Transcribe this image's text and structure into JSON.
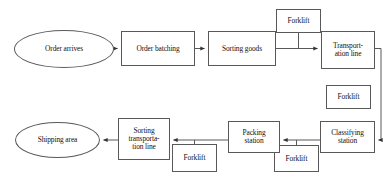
{
  "diagram": {
    "type": "flowchart",
    "canvas": {
      "width": 387,
      "height": 188
    },
    "style": {
      "stroke_color": "#595959",
      "text_color": "#111111",
      "background_color": "#ffffff"
    },
    "nodes": [
      {
        "id": "order-arrives",
        "label": "Order arrives",
        "shape": "ellipse",
        "x": 14,
        "y": 30,
        "w": 100,
        "h": 38,
        "font_size": 7.4
      },
      {
        "id": "order-batching",
        "label": "Order batching",
        "shape": "rect",
        "x": 121,
        "y": 31,
        "w": 74,
        "h": 35,
        "font_size": 7.4
      },
      {
        "id": "sorting-goods",
        "label": "Sorting goods",
        "shape": "rect",
        "x": 208,
        "y": 31,
        "w": 68,
        "h": 35,
        "font_size": 7.4
      },
      {
        "id": "forklift-top",
        "label": "Forklift",
        "shape": "rect",
        "x": 276,
        "y": 9,
        "w": 45,
        "h": 24,
        "font_size": 7.4
      },
      {
        "id": "transportation-line",
        "label": "Transport-\nation line",
        "shape": "rect",
        "x": 321,
        "y": 31,
        "w": 54,
        "h": 38,
        "font_size": 7.4
      },
      {
        "id": "forklift-right",
        "label": "Forklift",
        "shape": "rect",
        "x": 326,
        "y": 85,
        "w": 45,
        "h": 24,
        "font_size": 7.4
      },
      {
        "id": "classifying-station",
        "label": "Classifying\nstation",
        "shape": "rect",
        "x": 320,
        "y": 121,
        "w": 55,
        "h": 32,
        "font_size": 7.4
      },
      {
        "id": "forklift-bottom-right",
        "label": "Forklift",
        "shape": "rect",
        "x": 274,
        "y": 145,
        "w": 45,
        "h": 27,
        "font_size": 7.4
      },
      {
        "id": "packing-station",
        "label": "Packing\nstation",
        "shape": "rect",
        "x": 228,
        "y": 121,
        "w": 52,
        "h": 32,
        "font_size": 7.4
      },
      {
        "id": "forklift-bottom-left",
        "label": "Forklift",
        "shape": "rect",
        "x": 172,
        "y": 144,
        "w": 45,
        "h": 28,
        "font_size": 7.4
      },
      {
        "id": "sorting-transportation-line",
        "label": "Sorting\ntransporta-\ntion line",
        "shape": "rect",
        "x": 118,
        "y": 118,
        "w": 52,
        "h": 42,
        "font_size": 7.4
      },
      {
        "id": "shipping-area",
        "label": "Shipping area",
        "shape": "ellipse",
        "x": 15,
        "y": 122,
        "w": 85,
        "h": 36,
        "font_size": 7.4
      }
    ],
    "edges": [
      {
        "id": "e1",
        "from": "order-arrives",
        "to": "order-batching",
        "kind": "arrow",
        "direction": "right"
      },
      {
        "id": "e2",
        "from": "order-batching",
        "to": "sorting-goods",
        "kind": "arrow",
        "direction": "right"
      },
      {
        "id": "e3",
        "from": "sorting-goods",
        "to": "transportation-line",
        "kind": "arrow",
        "direction": "right"
      },
      {
        "id": "e4",
        "from": "forklift-top",
        "to": "e3",
        "kind": "line",
        "direction": "down"
      },
      {
        "id": "e5",
        "from": "transportation-line",
        "to": "classifying-station",
        "kind": "arrow",
        "direction": "left"
      },
      {
        "id": "e6",
        "from": "classifying-station",
        "to": "packing-station",
        "kind": "arrow",
        "direction": "left"
      },
      {
        "id": "e7",
        "from": "packing-station",
        "to": "sorting-transportation-line",
        "kind": "arrow",
        "direction": "left"
      },
      {
        "id": "e8",
        "from": "sorting-transportation-line",
        "to": "shipping-area",
        "kind": "arrow",
        "direction": "left"
      },
      {
        "id": "e9",
        "from": "forklift-bottom-right",
        "to": "e6",
        "kind": "line",
        "direction": "up"
      },
      {
        "id": "e10",
        "from": "forklift-bottom-left",
        "to": "e7",
        "kind": "line",
        "direction": "up"
      }
    ]
  }
}
